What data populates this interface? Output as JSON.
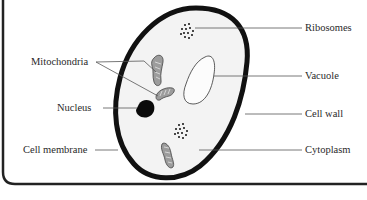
{
  "diagram": {
    "type": "plant-cell-labelled",
    "labels": {
      "ribosomes": "Ribosomes",
      "mitochondria": "Mitochondria",
      "vacuole": "Vacuole",
      "nucleus": "Nucleus",
      "cell_wall": "Cell wall",
      "cell_membrane": "Cell membrane",
      "cytoplasm": "Cytoplasm"
    },
    "colors": {
      "cell_wall": "#111111",
      "cytoplasm": "#f2f2f2",
      "organelle_fill": "#9a9a9a",
      "leader_line": "#555555",
      "frame": "#222222"
    }
  }
}
